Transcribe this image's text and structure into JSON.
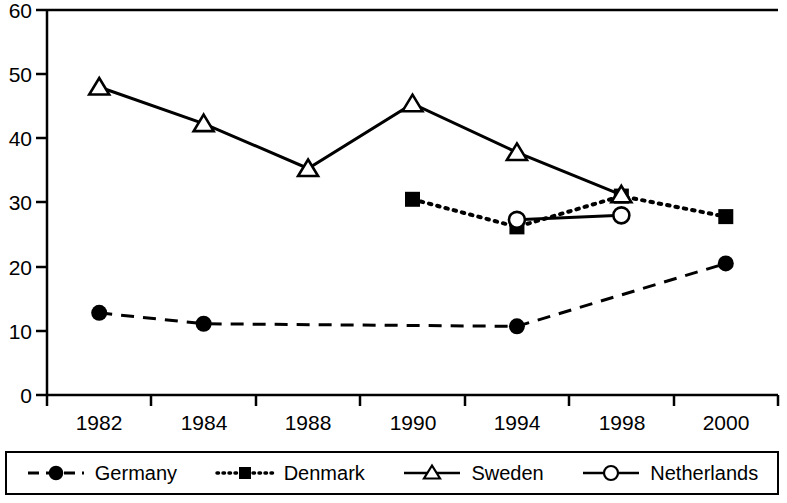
{
  "chart_data": {
    "type": "line",
    "title": "",
    "xlabel": "",
    "ylabel": "",
    "categories": [
      "1982",
      "1984",
      "1988",
      "1990",
      "1994",
      "1998",
      "2000"
    ],
    "ylim": [
      0,
      60
    ],
    "yticks": [
      "0",
      "10",
      "20",
      "30",
      "40",
      "50",
      "60"
    ],
    "grid": false,
    "legend_position": "bottom",
    "series": [
      {
        "name": "Germany",
        "marker": "filled-circle",
        "line_style": "dashed",
        "color": "#000000",
        "values": [
          12.8,
          11.1,
          null,
          null,
          10.7,
          null,
          20.5
        ]
      },
      {
        "name": "Denmark",
        "marker": "filled-square",
        "line_style": "dotted",
        "color": "#000000",
        "values": [
          null,
          null,
          null,
          30.5,
          26.2,
          31.0,
          27.8
        ]
      },
      {
        "name": "Sweden",
        "marker": "open-triangle",
        "line_style": "solid",
        "color": "#000000",
        "values": [
          48.0,
          42.3,
          35.3,
          45.4,
          37.8,
          31.2,
          null
        ]
      },
      {
        "name": "Netherlands",
        "marker": "open-circle",
        "line_style": "solid",
        "color": "#000000",
        "values": [
          null,
          null,
          null,
          null,
          27.3,
          28.0,
          null
        ]
      }
    ]
  },
  "axis": {
    "y_tick_0": "0",
    "y_tick_10": "10",
    "y_tick_20": "20",
    "y_tick_30": "30",
    "y_tick_40": "40",
    "y_tick_50": "50",
    "y_tick_60": "60",
    "x_tick_1982": "1982",
    "x_tick_1984": "1984",
    "x_tick_1988": "1988",
    "x_tick_1990": "1990",
    "x_tick_1994": "1994",
    "x_tick_1998": "1998",
    "x_tick_2000": "2000"
  },
  "legend": {
    "items": [
      {
        "label": "Germany"
      },
      {
        "label": "Denmark"
      },
      {
        "label": "Sweden"
      },
      {
        "label": "Netherlands"
      }
    ]
  }
}
